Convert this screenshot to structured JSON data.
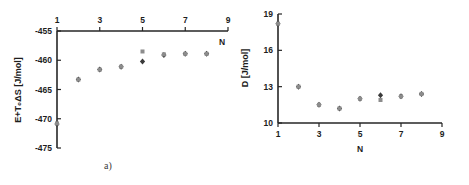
{
  "figure": {
    "panels": [
      {
        "id": "a",
        "caption": "a)",
        "xlabel": "N",
        "ylabel": "E+T₀ΔS  [J/mol]"
      },
      {
        "id": "b",
        "caption": "b)",
        "xlabel": "N",
        "ylabel": "D [J/mol]"
      }
    ]
  },
  "chart_data": [
    {
      "type": "scatter",
      "panel": "a",
      "title": "",
      "xlabel": "N",
      "ylabel": "E+T₀ΔS  [J/mol]",
      "xlim": [
        1,
        9
      ],
      "ylim": [
        -475,
        -455
      ],
      "xticks": [
        1,
        3,
        5,
        7,
        9
      ],
      "xticklabels": [
        "1",
        "3",
        "5",
        "7",
        "9"
      ],
      "yticks": [
        -455,
        -460,
        -465,
        -470,
        -475
      ],
      "yticklabels": [
        "-455",
        "-460",
        "-465",
        "-470",
        "-475"
      ],
      "xaxis_position": "top",
      "yaxis_position": "left",
      "grid": false,
      "legend": false,
      "series": [
        {
          "name": "series-diamond",
          "marker": "diamond",
          "color": "#3a3a3a",
          "x": [
            1,
            2,
            3,
            4,
            5,
            6,
            7,
            8
          ],
          "values": [
            -470.9,
            -463.3,
            -461.6,
            -461.1,
            -460.2,
            -459.1,
            -458.9,
            -458.9
          ]
        },
        {
          "name": "series-square",
          "marker": "square",
          "color": "#8c8c8c",
          "x": [
            1,
            2,
            3,
            4,
            5,
            6,
            7,
            8
          ],
          "values": [
            -470.8,
            -463.3,
            -461.6,
            -461.1,
            -458.5,
            -459.0,
            -458.9,
            -458.9
          ]
        }
      ]
    },
    {
      "type": "scatter",
      "panel": "b",
      "title": "",
      "xlabel": "N",
      "ylabel": "D [J/mol]",
      "xlim": [
        1,
        9
      ],
      "ylim": [
        10,
        19
      ],
      "xticks": [
        1,
        3,
        5,
        7,
        9
      ],
      "xticklabels": [
        "1",
        "3",
        "5",
        "7",
        "9"
      ],
      "yticks": [
        10,
        13,
        16,
        19
      ],
      "yticklabels": [
        "10",
        "13",
        "16",
        "19"
      ],
      "xaxis_position": "bottom",
      "yaxis_position": "left",
      "grid": false,
      "legend": false,
      "series": [
        {
          "name": "series-diamond",
          "marker": "diamond",
          "color": "#3a3a3a",
          "x": [
            1,
            2,
            3,
            4,
            5,
            6,
            7,
            8
          ],
          "values": [
            18.2,
            13.0,
            11.5,
            11.2,
            12.0,
            12.3,
            12.2,
            12.4
          ]
        },
        {
          "name": "series-square",
          "marker": "square",
          "color": "#8c8c8c",
          "x": [
            1,
            2,
            3,
            4,
            5,
            6,
            7,
            8
          ],
          "values": [
            18.2,
            13.0,
            11.5,
            11.2,
            12.0,
            11.9,
            12.2,
            12.4
          ]
        }
      ]
    }
  ]
}
